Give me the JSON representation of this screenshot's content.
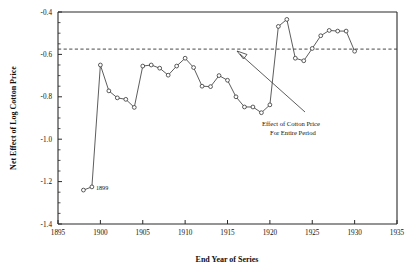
{
  "chart_data": {
    "type": "line",
    "title": "",
    "xlabel": "End Year of Series",
    "ylabel": "Net Effect of Log Cotton Price",
    "xlim": [
      1895,
      1935
    ],
    "ylim": [
      -1.4,
      -0.4
    ],
    "xticks": [
      1895,
      1900,
      1905,
      1910,
      1915,
      1920,
      1925,
      1930,
      1935
    ],
    "xticklabels": [
      "1895",
      "1900",
      "1905",
      "1910",
      "1915",
      "1920",
      "1925",
      "1930",
      "1935"
    ],
    "yticks": [
      -0.4,
      -0.6,
      -0.8,
      -1.0,
      -1.2,
      -1.4
    ],
    "yticklabels": [
      "-0.4",
      "-0.6",
      "-0.8",
      "-1.0",
      "-1.2",
      "-1.4"
    ],
    "grid": false,
    "legend": "none",
    "x": [
      1898,
      1899,
      1900,
      1901,
      1902,
      1903,
      1904,
      1905,
      1906,
      1907,
      1908,
      1909,
      1910,
      1911,
      1912,
      1913,
      1914,
      1915,
      1916,
      1917,
      1918,
      1919,
      1920,
      1921,
      1922,
      1923,
      1924,
      1925,
      1926,
      1927,
      1928,
      1929,
      1930
    ],
    "values": [
      -1.24,
      -1.225,
      -0.65,
      -0.772,
      -0.805,
      -0.812,
      -0.85,
      -0.655,
      -0.65,
      -0.665,
      -0.698,
      -0.655,
      -0.618,
      -0.662,
      -0.75,
      -0.752,
      -0.7,
      -0.722,
      -0.8,
      -0.848,
      -0.848,
      -0.875,
      -0.838,
      -0.468,
      -0.435,
      -0.618,
      -0.63,
      -0.572,
      -0.512,
      -0.487,
      -0.49,
      -0.49,
      -0.585
    ],
    "point_labels": [
      {
        "x": 1899,
        "value": -1.225,
        "text": "1899"
      }
    ],
    "reference_line": {
      "value": -0.575,
      "style": "dashed",
      "label": "Effect of Cotton Price\nFor Entire Period"
    },
    "annotations": [
      {
        "text_line1": "Effect of Cotton Price",
        "text_line2": "For Entire Period",
        "points_to": "reference-line"
      }
    ],
    "series_style": {
      "marker": "open-circle",
      "line_color": "#333333",
      "marker_face": "#ffffff"
    }
  },
  "figure": {
    "background": "#ffffff"
  }
}
